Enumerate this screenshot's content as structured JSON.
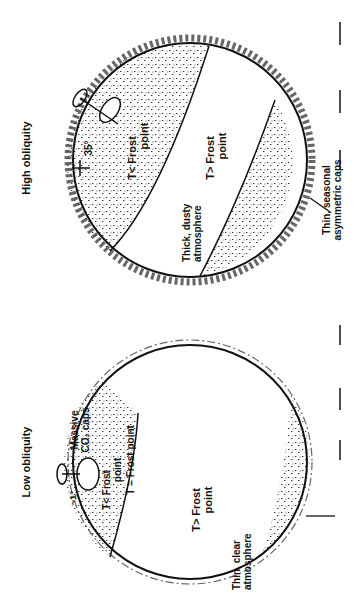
{
  "panels": [
    {
      "title": "High obliquity",
      "tilt_label": "35°",
      "cold_label_1": "T< Frost",
      "cold_label_2": "point",
      "warm_label_1": "T> Frost",
      "warm_label_2": "point",
      "atmosphere_label_1": "Thick, dusty",
      "atmosphere_label_2": "atmosphere",
      "caps_label_1": "Thin, seasonal",
      "caps_label_2": "asymmetric caps"
    },
    {
      "title": "Low obliquity",
      "tilt_label": "~1°",
      "caps_label_1": "Massive",
      "caps_label_2": "CO₂ caps",
      "cold_label_1": "T< Frost",
      "cold_label_2": "point",
      "boundary_label": "T = Frost point",
      "warm_label_1": "T> Frost",
      "warm_label_2": "point",
      "atmosphere_label_1": "Thin, clear",
      "atmosphere_label_2": "atmosphere"
    }
  ]
}
